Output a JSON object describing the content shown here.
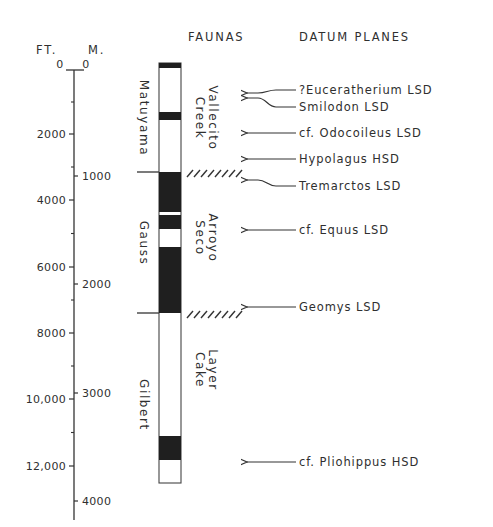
{
  "headers": {
    "ft": "FT.",
    "m": "M.",
    "faunas": "FAUNAS",
    "datum_planes": "DATUM PLANES"
  },
  "axis": {
    "ft_ticks": [
      {
        "label": "0",
        "y": 70
      },
      {
        "label": "2000",
        "y": 134
      },
      {
        "label": "4000",
        "y": 200
      },
      {
        "label": "6000",
        "y": 267
      },
      {
        "label": "8000",
        "y": 333
      },
      {
        "label": "10,000",
        "y": 399
      },
      {
        "label": "12,000",
        "y": 466
      }
    ],
    "m_ticks": [
      {
        "label": "0",
        "y": 70
      },
      {
        "label": "1000",
        "y": 176
      },
      {
        "label": "2000",
        "y": 284
      },
      {
        "label": "3000",
        "y": 393
      },
      {
        "label": "4000",
        "y": 501
      }
    ]
  },
  "magnetic_epochs": [
    {
      "name": "Matuyama",
      "y_center": 118
    },
    {
      "name": "Gauss",
      "y_center": 243
    },
    {
      "name": "Gilbert",
      "y_center": 405
    }
  ],
  "faunas": [
    {
      "line1": "Vallecito",
      "line2": "Creek",
      "y_center": 118
    },
    {
      "line1": "Arroyo",
      "line2": "Seco",
      "y_center": 238
    },
    {
      "line1": "Layer",
      "line2": "Cake",
      "y_center": 370
    }
  ],
  "polarity_column": {
    "top": 63,
    "bottom": 483,
    "black_segments": [
      [
        63,
        68
      ],
      [
        112,
        120
      ],
      [
        172,
        212
      ],
      [
        215,
        229
      ],
      [
        247,
        313
      ],
      [
        436,
        460
      ]
    ]
  },
  "boundaries": [
    172,
    313
  ],
  "datum_planes": [
    {
      "taxon": "?Eucerätherium LSD",
      "label": "?Euceratherium LSD",
      "arrow_y": 93,
      "text_y": 90
    },
    {
      "taxon": "Smilodon LSD",
      "label": "Smilodon LSD",
      "arrow_y": 98,
      "text_y": 107
    },
    {
      "taxon": "cf. Odocoileus LSD",
      "label": "cf. Odocoileus LSD",
      "arrow_y": 133,
      "text_y": 133
    },
    {
      "taxon": "Hypolagus HSD",
      "label": "Hypolagus HSD",
      "arrow_y": 159,
      "text_y": 159
    },
    {
      "taxon": "Tremarctos LSD",
      "label": "Tremarctos LSD",
      "arrow_y": 180,
      "text_y": 186
    },
    {
      "taxon": "cf. Equus LSD",
      "label": "cf. Equus LSD",
      "arrow_y": 230,
      "text_y": 230
    },
    {
      "taxon": "Geomys LSD",
      "label": "Geomys LSD",
      "arrow_y": 307,
      "text_y": 307
    },
    {
      "taxon": "cf. Pliohippus HSD",
      "label": "cf. Pliohippus HSD",
      "arrow_y": 462,
      "text_y": 462
    }
  ]
}
